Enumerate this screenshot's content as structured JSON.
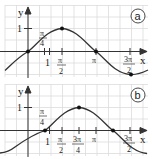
{
  "graphs": [
    {
      "id": "a",
      "badge": "a",
      "function": "sin(x)",
      "axis_labels": {
        "x": "x",
        "y": "y"
      },
      "y_tick": "1",
      "x_tick_unit": "1",
      "labeled_ticks": [
        {
          "num": "π",
          "den": "4"
        },
        {
          "num": "π",
          "den": "2"
        },
        {
          "num": "π",
          "den": ""
        },
        {
          "num": "3π",
          "den": "2"
        }
      ],
      "marked_points": [
        "(0,0)",
        "(π/2,1)",
        "(π,0)",
        "(3π/2,-1)"
      ]
    },
    {
      "id": "b",
      "badge": "b",
      "function": "sin(x - π/4)",
      "axis_labels": {
        "x": "x",
        "y": "y"
      },
      "y_tick": "1",
      "x_tick_unit": "1",
      "labeled_ticks": [
        {
          "num": "π",
          "den": "4"
        },
        {
          "num": "π",
          "den": "2"
        },
        {
          "num": "3π",
          "den": "4"
        },
        {
          "num": "π",
          "den": ""
        },
        {
          "num": "3π",
          "den": "2"
        }
      ],
      "marked_points": [
        "(π/4,0)",
        "(3π/4,1)",
        "(5π/4,0)"
      ]
    }
  ],
  "colors": {
    "grid": "#d9d9d9",
    "axis": "#333333",
    "curve": "#333333",
    "background": "#ffffff"
  }
}
